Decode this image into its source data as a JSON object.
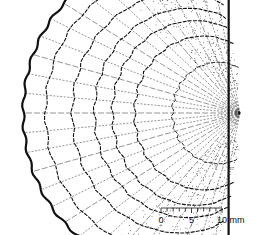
{
  "figure": {
    "colors": {
      "ink": "#111111",
      "background": "#ffffff"
    }
  },
  "scale_bar": {
    "tick_labels": [
      "0",
      "5",
      "10 mm"
    ],
    "range_mm": [
      0,
      10
    ],
    "minor_tick_step_mm": 1
  }
}
